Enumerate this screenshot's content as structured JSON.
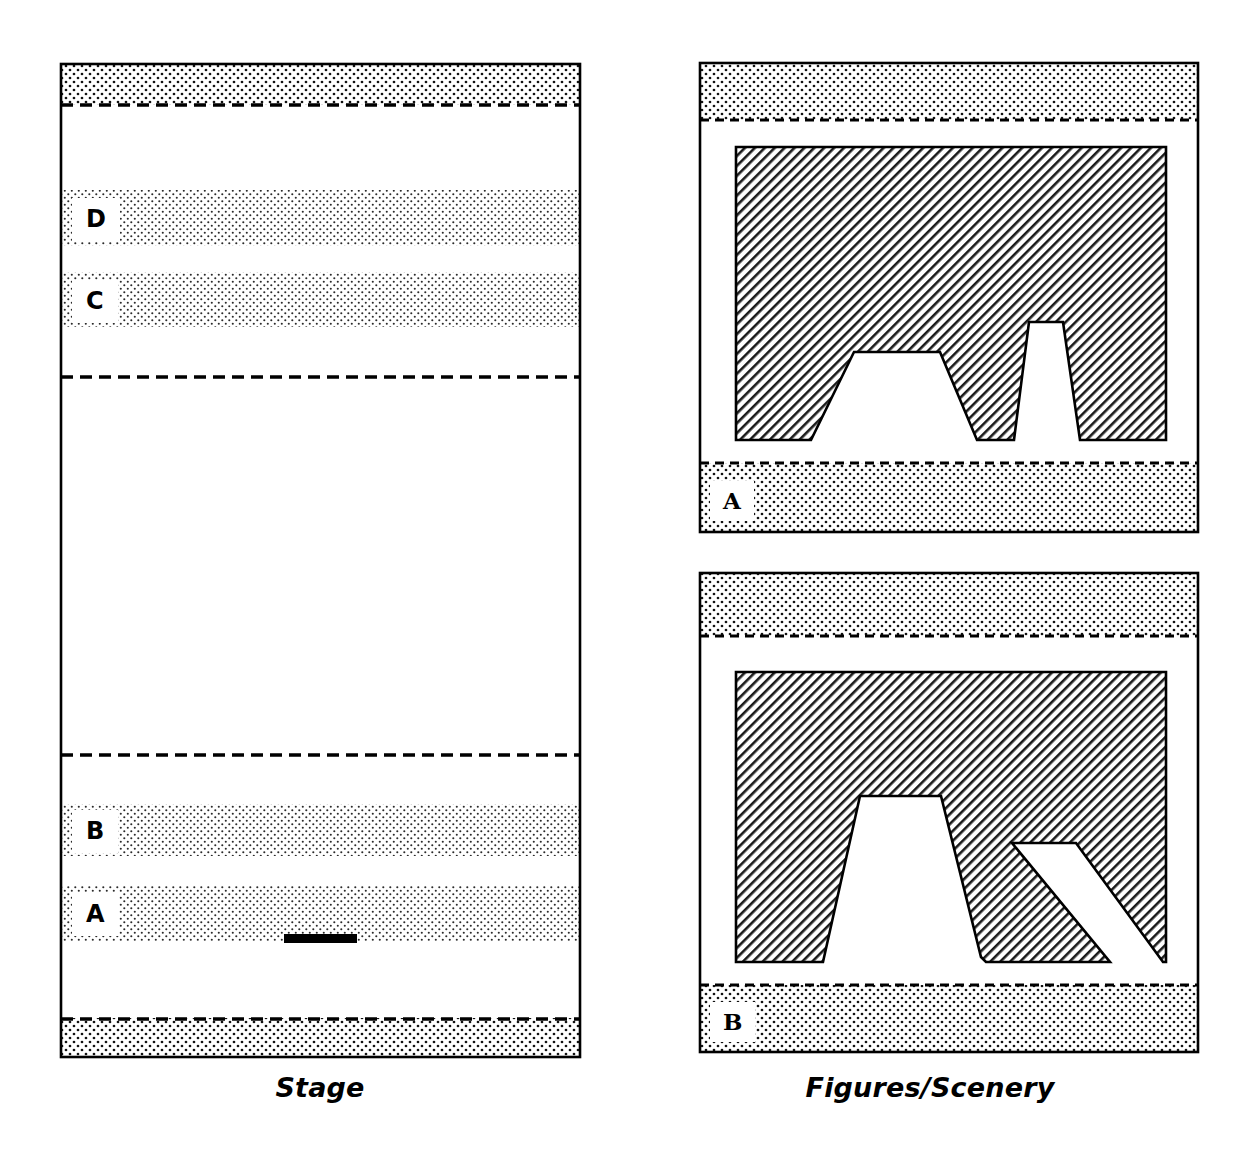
{
  "figure": {
    "width": 1245,
    "height": 1158,
    "background": "#ffffff",
    "ink": "#000000"
  },
  "captions": {
    "stage": "Stage",
    "figures": "Figures/Scenery"
  },
  "stage_panel": {
    "name": "Stage",
    "frame": {
      "x": 61,
      "y": 64,
      "width": 519,
      "height": 993
    },
    "top_dotted_band": {
      "y": 64,
      "height": 41,
      "fill": "dots-dark"
    },
    "bottom_dotted_band": {
      "y": 1018,
      "height": 39,
      "fill": "dots-dark"
    },
    "dashed_rules_y": [
      105,
      377,
      755,
      1019
    ],
    "bands": [
      {
        "label": "D",
        "y": 190,
        "height": 56,
        "fill": "dots-mid"
      },
      {
        "label": "C",
        "y": 272,
        "height": 55,
        "fill": "dots-mid"
      },
      {
        "label": "B",
        "y": 804,
        "height": 52,
        "fill": "dots-mid"
      },
      {
        "label": "A",
        "y": 886,
        "height": 55,
        "fill": "dots-mid"
      }
    ],
    "marker_bar": {
      "x": 284,
      "y": 934,
      "width": 73,
      "height": 9,
      "color": "#000000"
    }
  },
  "figure_panels": [
    {
      "label": "A",
      "frame": {
        "x": 700,
        "y": 63,
        "width": 498,
        "height": 469
      },
      "top_dotted_band": {
        "y": 63,
        "height": 57
      },
      "bottom_dotted_band": {
        "y": 463,
        "height": 69
      },
      "hatch_rect": {
        "x": 736,
        "y": 147,
        "width": 430,
        "height": 293
      },
      "notches": [
        {
          "bottom_left": 811,
          "bottom_right": 977,
          "top_left": 854,
          "top_right": 940,
          "top_y": 352
        },
        {
          "bottom_left": 1014,
          "bottom_right": 1080,
          "top_left": 1029,
          "top_right": 1063,
          "top_y": 322
        }
      ],
      "baseline_y": 440
    },
    {
      "label": "B",
      "frame": {
        "x": 700,
        "y": 573,
        "width": 498,
        "height": 479
      },
      "top_dotted_band": {
        "y": 573,
        "height": 63
      },
      "bottom_dotted_band": {
        "y": 985,
        "height": 67
      },
      "hatch_rect": {
        "x": 736,
        "y": 672,
        "width": 430,
        "height": 290
      },
      "notches": [
        {
          "bottom_left": 823,
          "bottom_right": 986,
          "top_left": 860,
          "top_right": 941,
          "top_y": 796
        },
        {
          "bottom_left": 1110,
          "bottom_right": 1163,
          "top_left": 1012,
          "top_right": 1076,
          "top_y": 843
        }
      ],
      "v_notch": {
        "apex_x": 981,
        "apex_y": 957
      },
      "baseline_y": 962
    }
  ]
}
